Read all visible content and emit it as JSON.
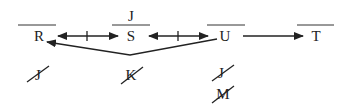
{
  "nodes": [
    {
      "id": "R",
      "label": "R",
      "x": 39,
      "y": 41,
      "overline": [
        18,
        56
      ],
      "above": ""
    },
    {
      "id": "S",
      "label": "S",
      "x": 131,
      "y": 41,
      "overline": [
        112,
        150
      ],
      "above": "J"
    },
    {
      "id": "U",
      "label": "U",
      "x": 225,
      "y": 41,
      "overline": [
        207,
        245
      ],
      "above": ""
    },
    {
      "id": "T",
      "label": "T",
      "x": 316,
      "y": 41,
      "overline": [
        297,
        334
      ],
      "above": ""
    }
  ],
  "edges": [
    {
      "from": "R",
      "to": "S",
      "type": "bidirectional-blocked"
    },
    {
      "from": "S",
      "to": "U",
      "type": "bidirectional-blocked"
    },
    {
      "from": "U",
      "to": "T",
      "type": "directed"
    },
    {
      "from": "U",
      "to": "R",
      "type": "directed-via-below-S"
    }
  ],
  "crossed_out": [
    {
      "under": "R",
      "label": "J"
    },
    {
      "under": "S",
      "label": "K"
    },
    {
      "under": "U",
      "label": "J"
    },
    {
      "under": "U",
      "label": "M"
    }
  ],
  "labels": {
    "R": "R",
    "S": "S",
    "U": "U",
    "T": "T",
    "S_above": "J",
    "x1": "J",
    "x2": "K",
    "x3": "J",
    "x4": "M"
  }
}
